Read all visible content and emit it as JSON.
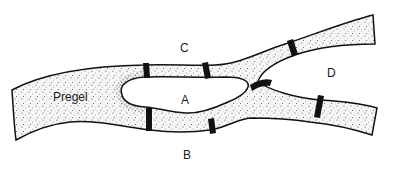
{
  "diagram": {
    "river_label": "Pregel",
    "land_labels": {
      "north_bank": "C",
      "island": "A",
      "south_bank": "B",
      "east_land": "D"
    },
    "bridge_count": 7,
    "colors": {
      "background": "#ffffff",
      "river_fill": "#f4f4f4",
      "stipple": "#333333",
      "outline": "#111111",
      "bridge": "#111111",
      "text": "#1a1a1a"
    }
  }
}
